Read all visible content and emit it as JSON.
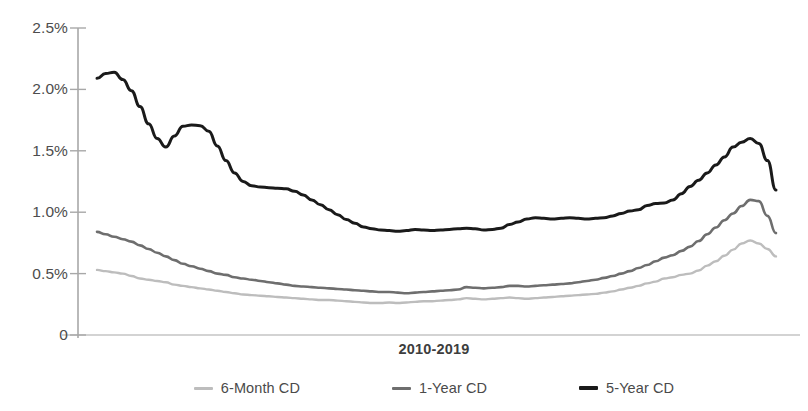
{
  "chart_data": {
    "type": "line",
    "title": "",
    "xlabel": "2010-2019",
    "ylabel": "",
    "ylim": [
      0,
      2.5
    ],
    "yticks": [
      "0",
      "0.5%",
      "1.0%",
      "1.5%",
      "2.0%",
      "2.5%"
    ],
    "ytick_values": [
      0,
      0.5,
      1.0,
      1.5,
      2.0,
      2.5
    ],
    "grid": false,
    "legend_position": "bottom",
    "x_range_label": "2010-2019",
    "x": [
      0,
      1,
      2,
      3,
      4,
      5,
      6,
      7,
      8,
      9,
      10,
      11,
      12,
      13,
      14,
      15,
      16,
      17,
      18,
      19,
      20,
      21,
      22,
      23,
      24,
      25,
      26,
      27,
      28,
      29,
      30,
      31,
      32,
      33,
      34,
      35,
      36,
      37,
      38,
      39,
      40,
      41,
      42,
      43,
      44,
      45,
      46,
      47,
      48,
      49,
      50,
      51,
      52,
      53,
      54,
      55,
      56,
      57,
      58,
      59,
      60,
      61,
      62,
      63,
      64,
      65,
      66,
      67,
      68,
      69,
      70,
      71,
      72,
      73,
      74,
      75,
      76,
      77,
      78,
      79
    ],
    "series": [
      {
        "name": "6-Month CD",
        "color": "#bdbdbd",
        "width": 2.4,
        "values": [
          0.53,
          0.52,
          0.51,
          0.5,
          0.48,
          0.46,
          0.45,
          0.44,
          0.43,
          0.41,
          0.4,
          0.39,
          0.38,
          0.37,
          0.36,
          0.35,
          0.34,
          0.33,
          0.325,
          0.32,
          0.315,
          0.31,
          0.305,
          0.3,
          0.295,
          0.29,
          0.285,
          0.285,
          0.28,
          0.275,
          0.27,
          0.265,
          0.26,
          0.26,
          0.265,
          0.26,
          0.265,
          0.27,
          0.275,
          0.275,
          0.28,
          0.285,
          0.29,
          0.3,
          0.295,
          0.29,
          0.295,
          0.3,
          0.305,
          0.3,
          0.295,
          0.3,
          0.305,
          0.31,
          0.315,
          0.32,
          0.325,
          0.33,
          0.335,
          0.345,
          0.355,
          0.37,
          0.385,
          0.4,
          0.42,
          0.435,
          0.46,
          0.47,
          0.49,
          0.5,
          0.525,
          0.565,
          0.6,
          0.645,
          0.695,
          0.745,
          0.77,
          0.745,
          0.7,
          0.64
        ]
      },
      {
        "name": "1-Year CD",
        "color": "#6e6e6e",
        "width": 2.6,
        "values": [
          0.84,
          0.82,
          0.8,
          0.78,
          0.76,
          0.73,
          0.7,
          0.67,
          0.64,
          0.61,
          0.58,
          0.56,
          0.54,
          0.52,
          0.5,
          0.49,
          0.47,
          0.46,
          0.45,
          0.44,
          0.43,
          0.42,
          0.41,
          0.4,
          0.395,
          0.39,
          0.385,
          0.38,
          0.375,
          0.37,
          0.365,
          0.36,
          0.355,
          0.35,
          0.35,
          0.345,
          0.34,
          0.345,
          0.35,
          0.355,
          0.36,
          0.365,
          0.37,
          0.39,
          0.385,
          0.38,
          0.385,
          0.39,
          0.4,
          0.4,
          0.395,
          0.4,
          0.405,
          0.41,
          0.415,
          0.42,
          0.43,
          0.44,
          0.45,
          0.465,
          0.48,
          0.5,
          0.52,
          0.545,
          0.57,
          0.6,
          0.63,
          0.65,
          0.685,
          0.72,
          0.765,
          0.82,
          0.875,
          0.935,
          0.99,
          1.05,
          1.1,
          1.09,
          0.97,
          0.83
        ]
      },
      {
        "name": "5-Year CD",
        "color": "#1a1a1a",
        "width": 3.0,
        "values": [
          2.09,
          2.13,
          2.14,
          2.08,
          1.99,
          1.86,
          1.72,
          1.6,
          1.53,
          1.62,
          1.7,
          1.71,
          1.705,
          1.66,
          1.54,
          1.42,
          1.32,
          1.25,
          1.215,
          1.205,
          1.2,
          1.195,
          1.19,
          1.17,
          1.14,
          1.1,
          1.06,
          1.02,
          0.98,
          0.94,
          0.91,
          0.88,
          0.865,
          0.855,
          0.85,
          0.845,
          0.85,
          0.86,
          0.855,
          0.85,
          0.855,
          0.86,
          0.865,
          0.87,
          0.865,
          0.855,
          0.86,
          0.87,
          0.9,
          0.92,
          0.945,
          0.955,
          0.95,
          0.945,
          0.95,
          0.955,
          0.95,
          0.945,
          0.95,
          0.955,
          0.97,
          0.99,
          1.01,
          1.02,
          1.055,
          1.07,
          1.075,
          1.1,
          1.15,
          1.21,
          1.26,
          1.32,
          1.385,
          1.45,
          1.53,
          1.57,
          1.6,
          1.56,
          1.42,
          1.18
        ]
      }
    ]
  },
  "axes": {
    "x_title": "2010-2019"
  },
  "legend": {
    "items": [
      {
        "label": "6-Month CD",
        "color": "#bdbdbd"
      },
      {
        "label": "1-Year CD",
        "color": "#6e6e6e"
      },
      {
        "label": "5-Year CD",
        "color": "#1a1a1a"
      }
    ]
  }
}
